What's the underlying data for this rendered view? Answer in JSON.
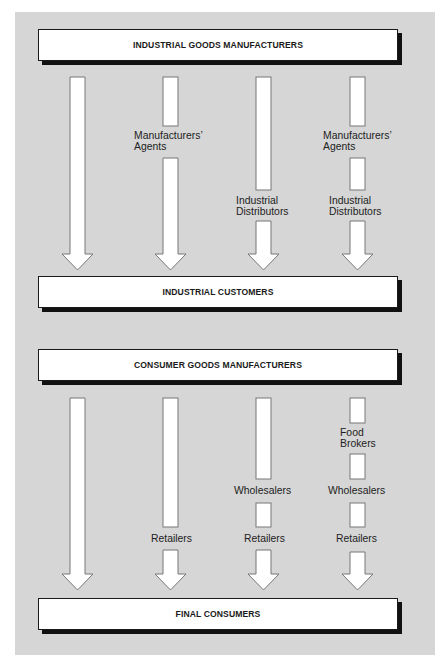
{
  "industrial": {
    "top_box": "INDUSTRIAL GOODS MANUFACTURERS",
    "bottom_box": "INDUSTRIAL CUSTOMERS",
    "channels": [
      {
        "intermediaries": []
      },
      {
        "intermediaries": [
          {
            "line1": "Manufacturers’",
            "line2": "Agents"
          }
        ]
      },
      {
        "intermediaries": [
          {
            "line1": "Industrial",
            "line2": "Distributors"
          }
        ]
      },
      {
        "intermediaries": [
          {
            "line1": "Manufacturers’",
            "line2": "Agents"
          },
          {
            "line1": "Industrial",
            "line2": "Distributors"
          }
        ]
      }
    ]
  },
  "consumer": {
    "top_box": "CONSUMER GOODS MANUFACTURERS",
    "bottom_box": "FINAL CONSUMERS",
    "channels": [
      {
        "intermediaries": []
      },
      {
        "intermediaries": [
          {
            "line1": "Retailers"
          }
        ]
      },
      {
        "intermediaries": [
          {
            "line1": "Wholesalers"
          },
          {
            "line1": "Retailers"
          }
        ]
      },
      {
        "intermediaries": [
          {
            "line1": "Food",
            "line2": "Brokers"
          },
          {
            "line1": "Wholesalers"
          },
          {
            "line1": "Retailers"
          }
        ]
      }
    ]
  },
  "colors": {
    "panel_background": "#d6d6d6",
    "box_fill": "#ffffff",
    "box_shadow": "#111111",
    "arrow_fill": "#ffffff",
    "arrow_stroke": "#777777"
  }
}
